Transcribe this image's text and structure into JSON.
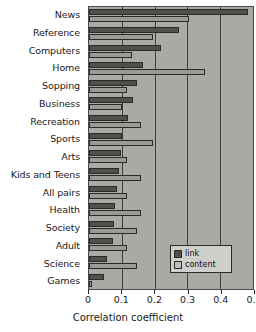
{
  "chart_data": {
    "type": "bar",
    "orientation": "horizontal",
    "title": "",
    "xlabel": "Correlation coefficient",
    "ylabel": "",
    "xlim": [
      0,
      0.5
    ],
    "xticks": [
      "0",
      "0.1",
      "0.2",
      "0.3",
      "0.4",
      "0.5"
    ],
    "xtick_values": [
      0,
      0.1,
      0.2,
      0.3,
      0.4,
      0.5
    ],
    "grid": "vertical",
    "legend_position": "lower right",
    "categories": [
      "News",
      "Reference",
      "Computers",
      "Home",
      "Sopping",
      "Business",
      "Recreation",
      "Sports",
      "Arts",
      "Kids and Teens",
      "All pairs",
      "Health",
      "Society",
      "Adult",
      "Science",
      "Games"
    ],
    "series": [
      {
        "name": "link",
        "color": "#4f4f4c",
        "values": [
          0.485,
          0.275,
          0.22,
          0.165,
          0.145,
          0.135,
          0.12,
          0.1,
          0.098,
          0.09,
          0.085,
          0.08,
          0.075,
          0.072,
          0.055,
          0.045
        ]
      },
      {
        "name": "content",
        "color": "#9a9a96",
        "values": [
          0.305,
          0.195,
          0.13,
          0.354,
          0.115,
          0.1,
          0.16,
          0.195,
          0.115,
          0.16,
          0.115,
          0.16,
          0.145,
          0.115,
          0.145,
          0.01
        ]
      }
    ]
  },
  "legend": {
    "entries": [
      {
        "label": "link"
      },
      {
        "label": "content"
      }
    ]
  },
  "colors": {
    "plot_background": "#a9a9a5",
    "link_bar": "#4f4f4c",
    "content_bar": "#9a9a96",
    "axis": "#2a2a28",
    "gridline": "#3d3d3b",
    "legend_background": "#cfcfcb"
  }
}
